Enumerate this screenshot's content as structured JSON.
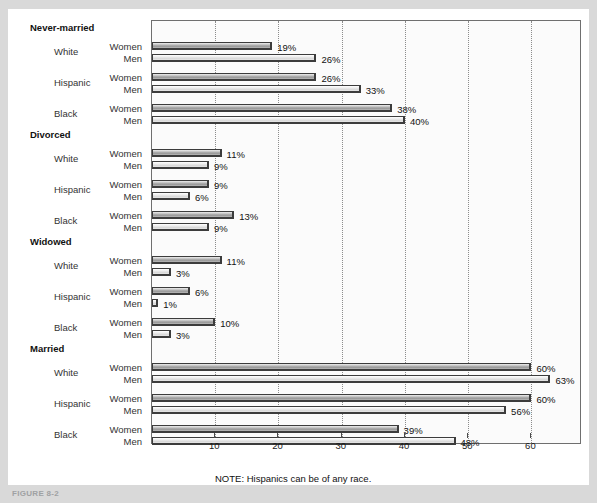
{
  "figure": {
    "caption": "FIGURE 8-2",
    "note": "NOTE: Hispanics can be of any race."
  },
  "chart_data": {
    "type": "bar",
    "orientation": "horizontal",
    "title": "",
    "xlabel": "",
    "ylabel": "",
    "xlim": [
      0,
      68
    ],
    "xticks": [
      10,
      20,
      30,
      40,
      50,
      60
    ],
    "xticklabels": [
      "10",
      "20",
      "30",
      "40",
      "50",
      "60"
    ],
    "grid": "vertical-dotted",
    "legend": "none",
    "value_suffix": "%",
    "series": [
      {
        "name": "Women",
        "color": "#a8a8a8"
      },
      {
        "name": "Men",
        "color": "#e2e2e2"
      }
    ],
    "groups": [
      {
        "label": "Never-married",
        "races": [
          {
            "label": "White",
            "women": 19,
            "men": 26
          },
          {
            "label": "Hispanic",
            "women": 26,
            "men": 33
          },
          {
            "label": "Black",
            "women": 38,
            "men": 40
          }
        ]
      },
      {
        "label": "Divorced",
        "races": [
          {
            "label": "White",
            "women": 11,
            "men": 9
          },
          {
            "label": "Hispanic",
            "women": 9,
            "men": 6
          },
          {
            "label": "Black",
            "women": 13,
            "men": 9
          }
        ]
      },
      {
        "label": "Widowed",
        "races": [
          {
            "label": "White",
            "women": 11,
            "men": 3
          },
          {
            "label": "Hispanic",
            "women": 6,
            "men": 1
          },
          {
            "label": "Black",
            "women": 10,
            "men": 3
          }
        ]
      },
      {
        "label": "Married",
        "races": [
          {
            "label": "White",
            "women": 60,
            "men": 63
          },
          {
            "label": "Hispanic",
            "women": 60,
            "men": 56
          },
          {
            "label": "Black",
            "women": 39,
            "men": 48
          }
        ]
      }
    ],
    "sex_labels": {
      "women": "Women",
      "men": "Men"
    }
  }
}
